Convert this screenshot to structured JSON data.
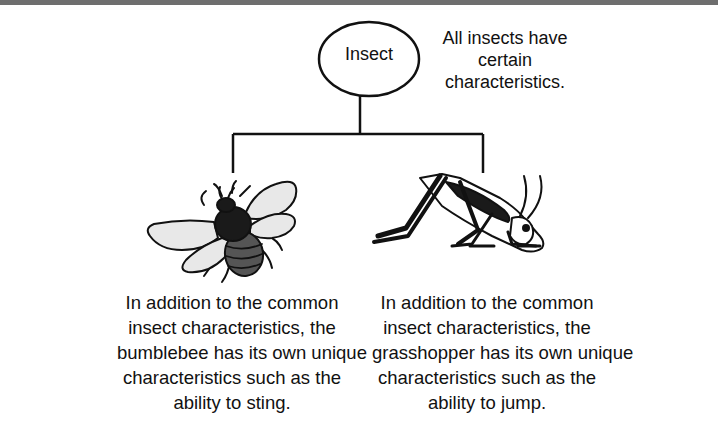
{
  "diagram": {
    "type": "hierarchy",
    "root": {
      "label": "Insect",
      "note_lines": [
        "All insects have",
        "certain characteristics."
      ]
    },
    "children": [
      {
        "name": "bumblebee",
        "illustration": "bumblebee-icon",
        "caption_lines": [
          "In addition to the common",
          "insect characteristics, the",
          "bumblebee has its own unique",
          "characteristics such as the",
          "ability to sting."
        ]
      },
      {
        "name": "grasshopper",
        "illustration": "grasshopper-icon",
        "caption_lines": [
          "In addition to the common",
          "insect characteristics, the",
          "grasshopper has its own unique",
          "characteristics such as the",
          "ability to jump."
        ]
      }
    ]
  },
  "colors": {
    "line": "#111111",
    "bee_wing": "#e8e8e8",
    "bee_thorax": "#1a1a1a",
    "bee_abdomen": "#555555",
    "top_border": "#6e6e6e",
    "background": "#ffffff"
  }
}
